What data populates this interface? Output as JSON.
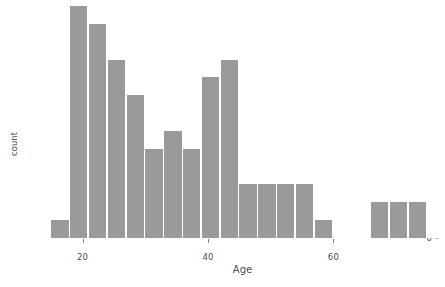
{
  "chart_data": {
    "type": "bar",
    "title": "",
    "xlabel": "Age",
    "ylabel": "count",
    "xlim": [
      14,
      77
    ],
    "ylim": [
      0,
      13
    ],
    "grid": false,
    "legend": null,
    "bar_color": "#9a9a9a",
    "background": "#ffffff",
    "binwidth": 3,
    "x_ticks": [
      20,
      40,
      60
    ],
    "x_tick_labels": [
      "20",
      "40",
      "60"
    ],
    "y_ticks": [
      0,
      5,
      10
    ],
    "y_tick_labels": [
      "0",
      "5",
      "10"
    ],
    "categories": [
      "15",
      "18",
      "21",
      "24",
      "27",
      "30",
      "33",
      "36",
      "39",
      "42",
      "45",
      "48",
      "51",
      "54",
      "57",
      "66",
      "69",
      "72"
    ],
    "bin_starts": [
      15,
      18,
      21,
      24,
      27,
      30,
      33,
      36,
      39,
      42,
      45,
      48,
      51,
      54,
      57,
      66,
      69,
      72
    ],
    "values": [
      1,
      13,
      12,
      10,
      8,
      5,
      6,
      5,
      9,
      10,
      3,
      3,
      3,
      3,
      1,
      2,
      2,
      2
    ]
  },
  "axes": {
    "y_label": "count",
    "x_label": "Age"
  },
  "top_caption": ""
}
